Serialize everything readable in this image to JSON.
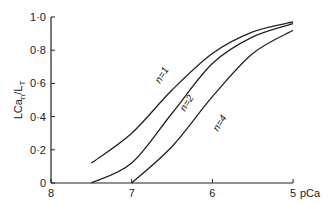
{
  "chart_data": {
    "type": "line",
    "title": "",
    "xlabel": "pCa",
    "ylabel": "LCa_n/L_T",
    "xlim": [
      8,
      5
    ],
    "ylim": [
      0,
      1.0
    ],
    "x_ticks": [
      "8",
      "7",
      "6",
      "5"
    ],
    "y_ticks": [
      "0",
      "0·2",
      "0·4",
      "0·6",
      "0·8",
      "1·0"
    ],
    "grid": false,
    "legend": "inline labels on curves",
    "series": [
      {
        "name": "n=1",
        "x": [
          7.5,
          7.0,
          6.5,
          6.0,
          5.5,
          5.0
        ],
        "values": [
          0.12,
          0.3,
          0.56,
          0.78,
          0.91,
          0.97
        ]
      },
      {
        "name": "n=2",
        "x": [
          7.5,
          7.0,
          6.5,
          6.0,
          5.5,
          5.0
        ],
        "values": [
          0.0,
          0.12,
          0.42,
          0.72,
          0.88,
          0.96
        ]
      },
      {
        "name": "n=4",
        "x": [
          7.0,
          6.5,
          6.0,
          5.5,
          5.0
        ],
        "values": [
          0.0,
          0.22,
          0.52,
          0.78,
          0.92
        ]
      }
    ]
  }
}
